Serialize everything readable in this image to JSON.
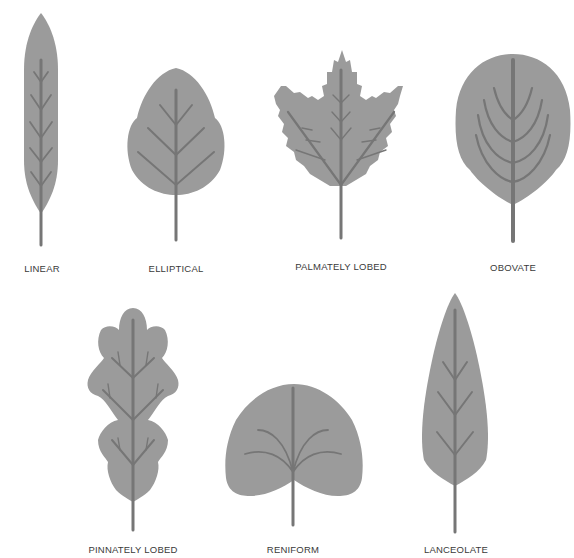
{
  "colors": {
    "leaf_fill": "#9b9b9b",
    "vein": "#767676",
    "label": "#3a3a3a",
    "background": "#ffffff"
  },
  "leaves": [
    {
      "name": "Linear",
      "label": "LINEAR"
    },
    {
      "name": "Elliptical",
      "label": "ELLIPTICAL"
    },
    {
      "name": "Palmately Lobed",
      "label": "PALMATELY LOBED"
    },
    {
      "name": "Obovate",
      "label": "OBOVATE"
    },
    {
      "name": "Pinnately Lobed",
      "label": "PINNATELY LOBED"
    },
    {
      "name": "Reniform",
      "label": "RENIFORM"
    },
    {
      "name": "Lanceolate",
      "label": "LANCEOLATE"
    }
  ]
}
